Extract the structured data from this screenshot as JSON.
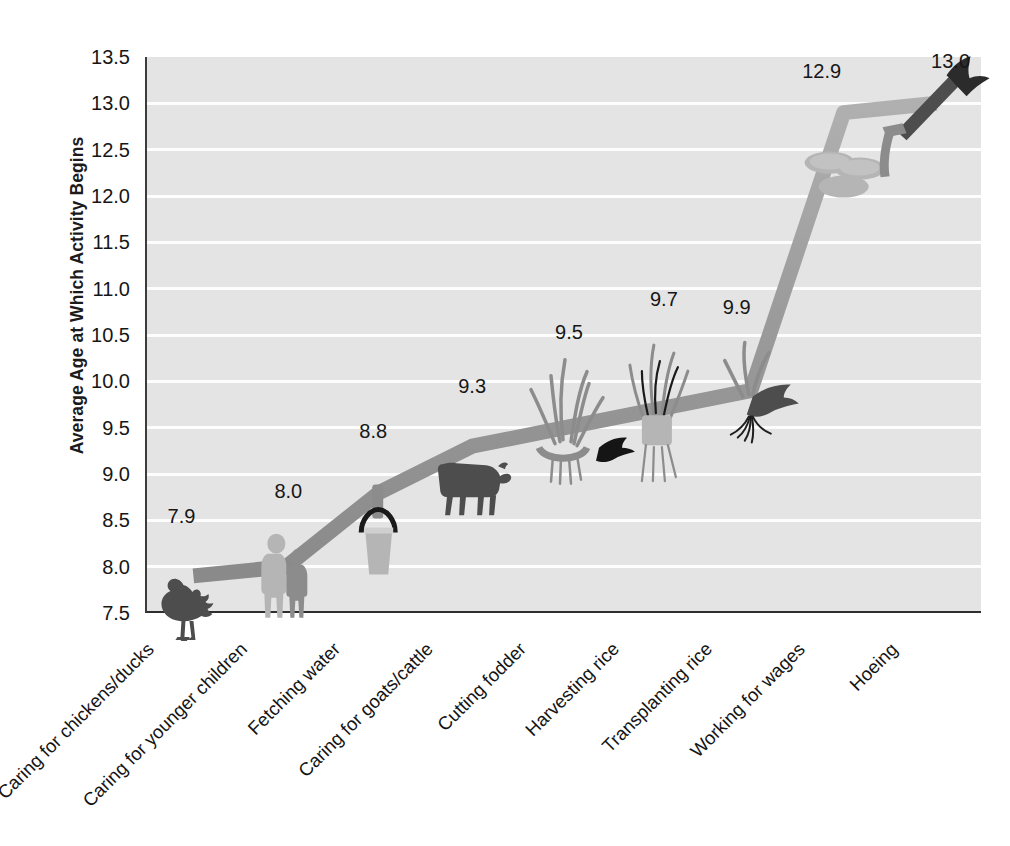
{
  "chart_data": {
    "type": "line",
    "title": "",
    "xlabel": "",
    "ylabel": "Average Age at Which Activity Begins",
    "ylim": [
      7.5,
      13.5
    ],
    "ytick_step": 0.5,
    "grid": true,
    "legend": "none",
    "categories": [
      "Caring for chickens/ducks",
      "Caring for younger children",
      "Fetching water",
      "Caring for goats/cattle",
      "Cutting fodder",
      "Harvesting  rice",
      "Transplanting rice",
      "Working for wages",
      "Hoeing"
    ],
    "values": [
      7.9,
      8.0,
      8.8,
      9.3,
      9.5,
      9.7,
      9.9,
      12.9,
      13.0
    ],
    "point_labels": [
      "7.9",
      "8.0",
      "8.8",
      "9.3",
      "9.5",
      "9.7",
      "9.9",
      "12.9",
      "13.0"
    ],
    "ytick_labels": [
      "13.5",
      "13.0",
      "12.5",
      "12.0",
      "11.5",
      "11.0",
      "10.5",
      "10.0",
      "9.5",
      "9.0",
      "8.5",
      "8.0",
      "7.5"
    ],
    "ytick_values": [
      13.5,
      13.0,
      12.5,
      12.0,
      11.5,
      11.0,
      10.5,
      10.0,
      9.5,
      9.0,
      8.5,
      8.0,
      7.5
    ],
    "pictograms": [
      "rooster-icon",
      "two-children-icon",
      "water-bucket-icon",
      "cow-icon",
      "fodder-grass-icon",
      "rice-sheaf-icon",
      "rice-seedling-icon",
      "coins-icon",
      "hoe-icon"
    ]
  },
  "colors": {
    "plot_background": "#e4e4e4",
    "gridline": "#fdfdfd",
    "line": "#9a9a9a",
    "axis": "#2e2e2e",
    "text": "#161616",
    "pictogram_dark": "#4d4d4d",
    "pictogram_mid": "#8c8c8c",
    "pictogram_light": "#b5b5b5",
    "page_background": "#ffffff"
  }
}
